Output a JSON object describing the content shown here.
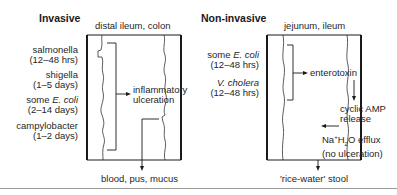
{
  "invasive": {
    "title": "Invasive",
    "site": "distal ileum, colon",
    "organisms": [
      {
        "name": "salmonella",
        "duration": "(12–48 hrs)"
      },
      {
        "name": "shigella",
        "duration": "(1–5 days)"
      },
      {
        "name_prefix": "some ",
        "name_italic": "E. coli",
        "duration": "(2–14 days)"
      },
      {
        "name": "campylobacter",
        "duration": "(1–2 days)"
      }
    ],
    "effect_line1": "inflammatory",
    "effect_line2": "ulceration",
    "output": "blood, pus, mucus"
  },
  "non_invasive": {
    "title": "Non-invasive",
    "site": "jejunum, ileum",
    "organisms": [
      {
        "name_prefix": "some ",
        "name_italic": "E. coli",
        "duration": "(12–48 hrs)"
      },
      {
        "name_italic": "V. cholera",
        "duration": "(12–48 hrs)"
      }
    ],
    "toxin": "enterotoxin",
    "camp_line1": "cyclic AMP",
    "camp_line2": "release",
    "efflux_na": "Na",
    "efflux_sup": "+",
    "efflux_h": "H",
    "efflux_sub": "2",
    "efflux_rest": "O efflux",
    "efflux_line2": "(no ulceration)",
    "output": "'rice-water' stool"
  },
  "colors": {
    "line": "#1a1a1a",
    "text": "#262626",
    "rule": "#9a9a9a"
  }
}
